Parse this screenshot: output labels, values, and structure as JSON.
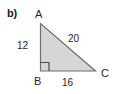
{
  "figure": {
    "part_label": "b)",
    "shape": "right-triangle",
    "fill_color": "#d6d6d6",
    "stroke_color": "#6e6e6e",
    "background_color": "#ffffff",
    "text_color": "#1f1f1f"
  },
  "vertices": {
    "a": "A",
    "b": "B",
    "c": "C"
  },
  "sides": {
    "ab": "12",
    "bc": "16",
    "ac": "20"
  },
  "markers": {
    "right_angle_at": "B"
  }
}
